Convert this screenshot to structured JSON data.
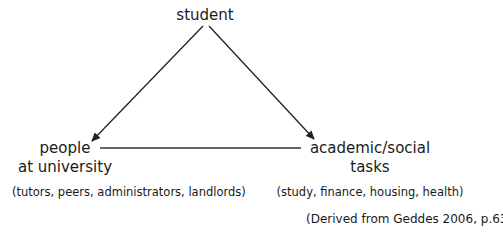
{
  "diagram": {
    "type": "triangle",
    "nodes": {
      "top": {
        "label": "student"
      },
      "left": {
        "line1": "people",
        "line2": "at university",
        "examples": "(tutors, peers, administrators, landlords)"
      },
      "right": {
        "line1": "academic/social",
        "line2": "tasks",
        "examples": "(study, finance, housing, health)"
      }
    },
    "edges": [
      {
        "from": "student",
        "to": "people at university",
        "style": "arrow"
      },
      {
        "from": "student",
        "to": "academic/social tasks",
        "style": "arrow"
      },
      {
        "from": "people at university",
        "to": "academic/social tasks",
        "style": "line"
      }
    ],
    "citation": "(Derived from Geddes 2006, p.63)",
    "colors": {
      "line": "#222222",
      "text": "#1a1a1a",
      "background": "#ffffff"
    }
  }
}
